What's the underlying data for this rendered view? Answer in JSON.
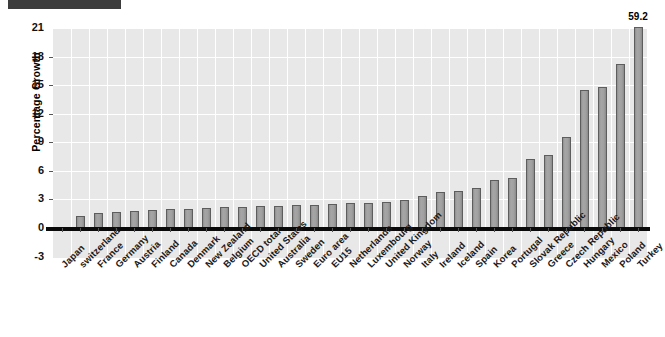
{
  "chart_data": {
    "type": "bar",
    "title": "",
    "xlabel": "",
    "ylabel": "Percentage Growth",
    "ylim": [
      -3,
      21
    ],
    "yticks": [
      -3,
      0,
      3,
      6,
      9,
      12,
      15,
      18,
      21
    ],
    "grid": true,
    "legend": false,
    "bar_color": "#9a9a9a",
    "bar_edge_color": "#5d5d5d",
    "plot_background": "#e8e8e8",
    "categories": [
      "Japan",
      "switzerland",
      "France",
      "Germany",
      "Austria",
      "Finland",
      "Canada",
      "Denmark",
      "New Zealand",
      "Belgium",
      "OECD total",
      "United States",
      "Australia",
      "Sweden",
      "Euro area",
      "EU15",
      "Netherlands",
      "Luxembourg",
      "United Kingdom",
      "Norway",
      "Italy",
      "Ireland",
      "Iceland",
      "Spain",
      "Korea",
      "Portugal",
      "Slovak Republic",
      "Greece",
      "Czech Republic",
      "Hungary",
      "Mexico",
      "Poland",
      "Turkey"
    ],
    "values": [
      0.1,
      1.3,
      1.6,
      1.7,
      1.8,
      1.9,
      2.0,
      2.0,
      2.1,
      2.2,
      2.2,
      2.3,
      2.3,
      2.4,
      2.4,
      2.5,
      2.6,
      2.6,
      2.7,
      2.9,
      3.4,
      3.8,
      3.9,
      4.2,
      5.0,
      5.2,
      7.2,
      7.7,
      9.6,
      14.5,
      14.8,
      17.2,
      59.2
    ],
    "annotations": [
      {
        "category": "Turkey",
        "text": "59.2",
        "note": "value exceeds axis maximum; bar is clipped at top of plot"
      }
    ],
    "clip_max": 21
  },
  "redaction": {
    "name": "redacted-title-block",
    "color": "#3c3c3c"
  }
}
